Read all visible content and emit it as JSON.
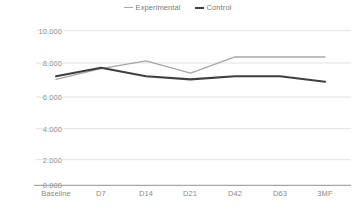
{
  "legend": {
    "position": "top-center",
    "items": [
      {
        "label": "Experimental",
        "color": "#a6a6a6",
        "marker": "line-swatch-icon"
      },
      {
        "label": "Control",
        "color": "#3f3f3f",
        "marker": "line-swatch-icon"
      }
    ]
  },
  "chart_data": {
    "type": "line",
    "title": "",
    "xlabel": "",
    "ylabel": "",
    "categories": [
      "Baseline",
      "D7",
      "D14",
      "D21",
      "D42",
      "D63",
      "3MF"
    ],
    "ylim": [
      0,
      10
    ],
    "yticks": [
      0,
      2,
      4,
      6,
      8,
      10
    ],
    "ytick_labels": [
      "0.000",
      "2.000",
      "4.000",
      "6.000",
      "8.000",
      "10.000"
    ],
    "grid": "horizontal",
    "legend": "top-center",
    "series": [
      {
        "name": "Experimental",
        "color": "#a6a6a6",
        "width": 1.3,
        "values": [
          6.85,
          7.55,
          8.05,
          7.25,
          8.3,
          8.3,
          8.3
        ]
      },
      {
        "name": "Control",
        "color": "#3f3f3f",
        "width": 2.1,
        "values": [
          7.05,
          7.6,
          7.05,
          6.85,
          7.05,
          7.05,
          6.7
        ]
      }
    ]
  },
  "axis": {
    "grid_color": "#d9d9d9",
    "baseline_color": "#a6a6a6",
    "tick_text_color": "#8a8a8a"
  }
}
